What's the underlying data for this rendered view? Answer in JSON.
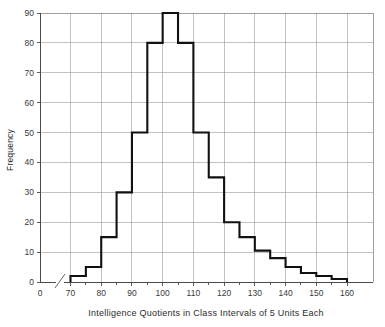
{
  "chart_data": {
    "type": "bar",
    "title": "",
    "xlabel": "Intelligence Quotients in Class Intervals of 5 Units Each",
    "ylabel": "Frequency",
    "xlim": [
      65,
      170
    ],
    "ylim": [
      0,
      90
    ],
    "grid": true,
    "legend": null,
    "axis_break": {
      "present": true,
      "between": [
        0,
        65
      ],
      "symbol": "/"
    },
    "x_tick_labels": [
      "0",
      "70",
      "80",
      "90",
      "100",
      "110",
      "120",
      "130",
      "140",
      "150",
      "160"
    ],
    "x_tick_values": [
      0,
      70,
      80,
      90,
      100,
      110,
      120,
      130,
      140,
      150,
      160
    ],
    "y_tick_labels": [
      "0",
      "10",
      "20",
      "30",
      "40",
      "50",
      "60",
      "70",
      "80",
      "90"
    ],
    "y_tick_values": [
      0,
      10,
      20,
      30,
      40,
      50,
      60,
      70,
      80,
      90
    ],
    "bin_width": 5,
    "bin_edges": [
      70,
      75,
      80,
      85,
      90,
      95,
      100,
      105,
      110,
      115,
      120,
      125,
      130,
      135,
      140,
      145,
      150,
      155,
      160
    ],
    "categories": [
      "70-75",
      "75-80",
      "80-85",
      "85-90",
      "90-95",
      "95-100",
      "100-105",
      "105-110",
      "110-115",
      "115-120",
      "120-125",
      "125-130",
      "130-135",
      "135-140",
      "140-145",
      "145-150",
      "150-155",
      "155-160"
    ],
    "values": [
      2,
      5,
      15,
      30,
      50,
      80,
      90,
      80,
      50,
      35,
      20,
      15,
      10.5,
      8,
      5,
      3,
      2,
      1
    ]
  },
  "style": {
    "line_color": "#111111",
    "grid_color": "#9a9a9a",
    "axis_color": "#4a4a4a",
    "text_color": "#2b2b2b",
    "background": "#ffffff"
  }
}
